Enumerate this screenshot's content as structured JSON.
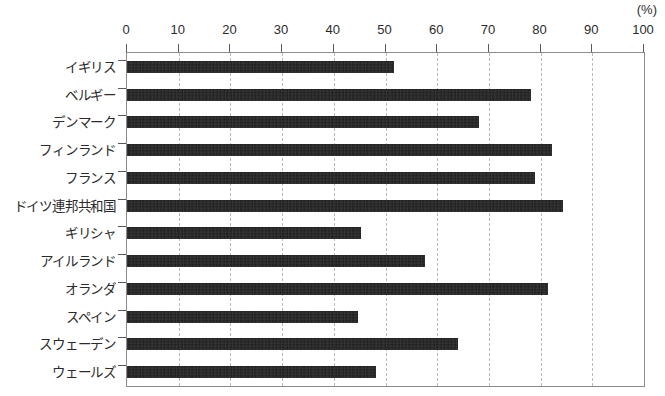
{
  "chart_data": {
    "type": "bar",
    "orientation": "horizontal",
    "title": "",
    "subtitle": "",
    "xlabel": "",
    "ylabel": "",
    "unit_label": "(%)",
    "xlim": [
      0,
      100
    ],
    "xticks": [
      0,
      10,
      20,
      30,
      40,
      50,
      60,
      70,
      80,
      90,
      100
    ],
    "xtick_labels": [
      "0",
      "10",
      "20",
      "30",
      "40",
      "50",
      "60",
      "70",
      "80",
      "90",
      "100"
    ],
    "grid": true,
    "grid_axis": "x",
    "grid_style": "dashed",
    "legend": false,
    "legend_position": "none",
    "bar_color": "#1c1c1c",
    "grid_color": "#b9b9b9",
    "frame_color": "#8c8c8c",
    "categories": [
      "イギリス",
      "ベルギー",
      "デンマーク",
      "フィンランド",
      "フランス",
      "ドイツ連邦共和国",
      "ギリシャ",
      "アイルランド",
      "オランダ",
      "スペイン",
      "スウェーデン",
      "ウェールズ"
    ],
    "values": [
      51.6,
      78.1,
      68.1,
      82.2,
      78.9,
      84.3,
      45.3,
      57.6,
      81.4,
      44.7,
      64.0,
      48.2
    ]
  }
}
